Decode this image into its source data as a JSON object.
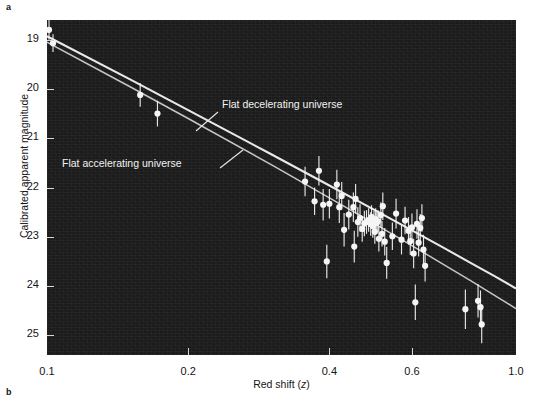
{
  "figure": {
    "panel_a_label": "a",
    "panel_b_label": "b"
  },
  "chart_data": {
    "type": "scatter",
    "title": "",
    "xlabel": "Red shift (z)",
    "ylabel": "Calibrated apparent magnitude",
    "xscale": "log",
    "xlim": [
      0.1,
      1.0
    ],
    "ylim": [
      18.6,
      25.4
    ],
    "y_inverted": true,
    "grid": false,
    "legend_position": "inline-annotations",
    "xticks": [
      0.1,
      0.2,
      0.4,
      0.6,
      1.0
    ],
    "xtick_labels": [
      "0.1",
      "0.2",
      "0.4",
      "0.6",
      "1.0"
    ],
    "yticks": [
      19,
      20,
      21,
      22,
      23,
      24,
      25
    ],
    "ytick_labels": [
      "19",
      "20",
      "21",
      "22",
      "23",
      "24",
      "25"
    ],
    "background_color": "#1b1b1b",
    "marker_color": "#f5f5f5",
    "curve_color": "#f0f0f0",
    "annotations": [
      {
        "text": "Flat decelerating universe",
        "x_px": 222,
        "y_px": 105,
        "leader_from": [
          218,
          112
        ],
        "leader_to": [
          196,
          131
        ]
      },
      {
        "text": "Flat accelerating universe",
        "x_px": 62,
        "y_px": 164,
        "leader_from": [
          220,
          168
        ],
        "leader_to": [
          243,
          150
        ]
      }
    ],
    "curves": [
      {
        "name": "Flat decelerating universe",
        "points": [
          [
            0.1,
            18.93
          ],
          [
            0.15,
            19.8
          ],
          [
            0.2,
            20.43
          ],
          [
            0.3,
            21.32
          ],
          [
            0.4,
            21.96
          ],
          [
            0.5,
            22.46
          ],
          [
            0.6,
            22.87
          ],
          [
            0.7,
            23.22
          ],
          [
            0.8,
            23.53
          ],
          [
            0.9,
            23.8
          ],
          [
            1.0,
            24.05
          ]
        ]
      },
      {
        "name": "Flat accelerating universe",
        "points": [
          [
            0.1,
            19.05
          ],
          [
            0.15,
            19.95
          ],
          [
            0.2,
            20.6
          ],
          [
            0.3,
            21.53
          ],
          [
            0.4,
            22.21
          ],
          [
            0.5,
            22.74
          ],
          [
            0.6,
            23.18
          ],
          [
            0.7,
            23.56
          ],
          [
            0.8,
            23.89
          ],
          [
            0.9,
            24.19
          ],
          [
            1.0,
            24.46
          ]
        ]
      }
    ],
    "series": [
      {
        "name": "Type Ia supernovae",
        "marker": "filled-circle",
        "points": [
          {
            "z": 0.101,
            "mag": 18.8,
            "err": 0.2
          },
          {
            "z": 0.103,
            "mag": 19.07,
            "err": 0.18
          },
          {
            "z": 0.158,
            "mag": 20.12,
            "err": 0.24
          },
          {
            "z": 0.172,
            "mag": 20.5,
            "err": 0.26
          },
          {
            "z": 0.355,
            "mag": 21.88,
            "err": 0.3
          },
          {
            "z": 0.372,
            "mag": 22.28,
            "err": 0.28
          },
          {
            "z": 0.38,
            "mag": 21.66,
            "err": 0.3
          },
          {
            "z": 0.388,
            "mag": 22.35,
            "err": 0.32
          },
          {
            "z": 0.395,
            "mag": 23.5,
            "err": 0.34
          },
          {
            "z": 0.4,
            "mag": 22.33,
            "err": 0.3
          },
          {
            "z": 0.415,
            "mag": 21.94,
            "err": 0.3
          },
          {
            "z": 0.42,
            "mag": 22.4,
            "err": 0.32
          },
          {
            "z": 0.425,
            "mag": 22.17,
            "err": 0.28
          },
          {
            "z": 0.43,
            "mag": 22.86,
            "err": 0.34
          },
          {
            "z": 0.44,
            "mag": 22.55,
            "err": 0.3
          },
          {
            "z": 0.45,
            "mag": 22.4,
            "err": 0.3
          },
          {
            "z": 0.452,
            "mag": 23.2,
            "err": 0.32
          },
          {
            "z": 0.455,
            "mag": 22.23,
            "err": 0.3
          },
          {
            "z": 0.46,
            "mag": 22.7,
            "err": 0.3
          },
          {
            "z": 0.465,
            "mag": 22.62,
            "err": 0.28
          },
          {
            "z": 0.47,
            "mag": 22.84,
            "err": 0.26
          },
          {
            "z": 0.475,
            "mag": 22.73,
            "err": 0.26
          },
          {
            "z": 0.48,
            "mag": 22.7,
            "err": 0.24
          },
          {
            "z": 0.485,
            "mag": 22.66,
            "err": 0.24
          },
          {
            "z": 0.49,
            "mag": 22.74,
            "err": 0.24
          },
          {
            "z": 0.492,
            "mag": 22.6,
            "err": 0.24
          },
          {
            "z": 0.495,
            "mag": 22.78,
            "err": 0.24
          },
          {
            "z": 0.498,
            "mag": 22.69,
            "err": 0.22
          },
          {
            "z": 0.5,
            "mag": 22.9,
            "err": 0.24
          },
          {
            "z": 0.502,
            "mag": 22.64,
            "err": 0.22
          },
          {
            "z": 0.505,
            "mag": 22.72,
            "err": 0.22
          },
          {
            "z": 0.508,
            "mag": 22.68,
            "err": 0.22
          },
          {
            "z": 0.51,
            "mag": 23.04,
            "err": 0.26
          },
          {
            "z": 0.515,
            "mag": 22.56,
            "err": 0.26
          },
          {
            "z": 0.518,
            "mag": 22.94,
            "err": 0.26
          },
          {
            "z": 0.52,
            "mag": 22.38,
            "err": 0.28
          },
          {
            "z": 0.525,
            "mag": 23.1,
            "err": 0.28
          },
          {
            "z": 0.53,
            "mag": 23.53,
            "err": 0.32
          },
          {
            "z": 0.545,
            "mag": 22.99,
            "err": 0.28
          },
          {
            "z": 0.555,
            "mag": 22.53,
            "err": 0.3
          },
          {
            "z": 0.57,
            "mag": 23.06,
            "err": 0.3
          },
          {
            "z": 0.58,
            "mag": 22.67,
            "err": 0.28
          },
          {
            "z": 0.59,
            "mag": 22.88,
            "err": 0.28
          },
          {
            "z": 0.595,
            "mag": 23.09,
            "err": 0.28
          },
          {
            "z": 0.6,
            "mag": 22.81,
            "err": 0.28
          },
          {
            "z": 0.605,
            "mag": 23.34,
            "err": 0.3
          },
          {
            "z": 0.61,
            "mag": 24.33,
            "err": 0.36
          },
          {
            "z": 0.615,
            "mag": 22.74,
            "err": 0.3
          },
          {
            "z": 0.62,
            "mag": 23.12,
            "err": 0.28
          },
          {
            "z": 0.625,
            "mag": 22.82,
            "err": 0.28
          },
          {
            "z": 0.63,
            "mag": 22.62,
            "err": 0.28
          },
          {
            "z": 0.635,
            "mag": 23.26,
            "err": 0.3
          },
          {
            "z": 0.64,
            "mag": 23.59,
            "err": 0.32
          },
          {
            "z": 0.78,
            "mag": 24.47,
            "err": 0.4
          },
          {
            "z": 0.83,
            "mag": 24.3,
            "err": 0.34
          },
          {
            "z": 0.84,
            "mag": 24.43,
            "err": 0.34
          },
          {
            "z": 0.845,
            "mag": 24.78,
            "err": 0.38
          }
        ]
      }
    ]
  }
}
